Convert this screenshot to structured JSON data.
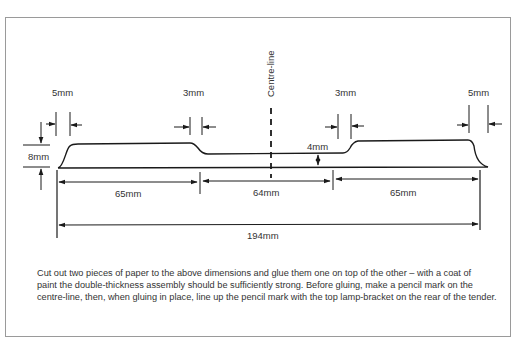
{
  "diagram": {
    "centre_line_label": "Centre-line",
    "labels": {
      "left_end_gap": "5mm",
      "left_step_gap": "3mm",
      "right_step_gap": "3mm",
      "right_end_gap": "5mm",
      "height": "8mm",
      "step_height": "4mm",
      "left_section": "65mm",
      "centre_section": "64mm",
      "right_section": "65mm",
      "overall_length": "194mm"
    },
    "colors": {
      "line": "#1a1a1a",
      "frame": "#9a9a9a",
      "text": "#333333"
    }
  },
  "caption": {
    "lines": [
      "Cut out two pieces of paper to the above dimensions and glue them one on top of the other – with a coat of",
      "paint the double-thickness assembly should be sufficiently strong. Before gluing, make a pencil mark on the",
      "centre-line, then, when gluing in place, line up the pencil mark with the top lamp-bracket on the rear of the tender."
    ]
  }
}
